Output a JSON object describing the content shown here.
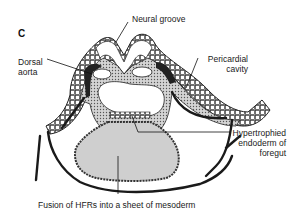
{
  "figure": {
    "panel_letter": "C",
    "labels": {
      "neural_groove": "Neural groove",
      "dorsal_aorta_line1": "Dorsal",
      "dorsal_aorta_line2": "aorta",
      "pericardial_line1": "Pericardial",
      "pericardial_line2": "cavity",
      "hyper_line1": "Hypertrophied",
      "hyper_line2": "endoderm of",
      "hyper_line3": "foregut",
      "fusion": "Fusion of HFRs into a sheet of mesoderm"
    },
    "colors": {
      "ink": "#1a1a1a",
      "stipple_fill": "#b8b8b8",
      "mesoderm_fill": "#cfcfcf",
      "background": "#ffffff"
    }
  }
}
